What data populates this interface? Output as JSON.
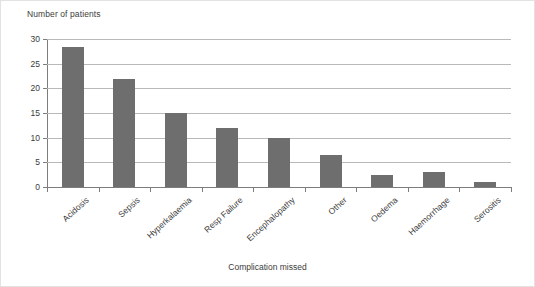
{
  "chart_data": {
    "type": "bar",
    "title": "",
    "xlabel": "Complication missed",
    "ylabel": "Number of patients",
    "categories": [
      "Acidosis",
      "Sepsis",
      "Hyperkalaemia",
      "Resp Failure",
      "Encephalopathy",
      "Other",
      "Oedema",
      "Haemorrhage",
      "Serositis"
    ],
    "values": [
      28.3,
      21.8,
      15.0,
      12.0,
      10.0,
      6.5,
      2.5,
      3.0,
      1.0
    ],
    "ylim": [
      0,
      30
    ],
    "yticks": [
      0,
      5,
      10,
      15,
      20,
      25,
      30
    ],
    "ytick_labels": [
      "0",
      "5",
      "10",
      "15",
      "20",
      "25",
      "30"
    ],
    "grid": true,
    "legend": "none",
    "bar_color": "#6e6e6e",
    "axis_color": "#7d7d7d",
    "grid_color": "#b9b9b9",
    "text_color": "#3b3b3b"
  }
}
